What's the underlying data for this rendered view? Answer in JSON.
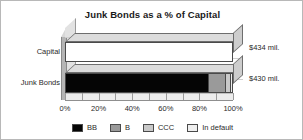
{
  "chart_data": {
    "type": "bar",
    "orientation": "horizontal",
    "stacked": true,
    "title": "Junk Bonds as a % of Capital",
    "xlabel": "",
    "ylabel": "",
    "xlim": [
      0,
      100
    ],
    "xtick_labels": [
      "0%",
      "20%",
      "40%",
      "60%",
      "80%",
      "100%"
    ],
    "xtick_values": [
      0,
      20,
      40,
      60,
      80,
      100
    ],
    "minor_tick_step": 10,
    "grid": true,
    "legend_position": "bottom",
    "categories": [
      "Capital",
      "Junk Bonds"
    ],
    "series": [
      {
        "name": "BB",
        "color": "#050505",
        "values": [
          0,
          86
        ]
      },
      {
        "name": "B",
        "color": "#9a9a9a",
        "values": [
          0,
          10
        ]
      },
      {
        "name": "CCC",
        "color": "#c9c9c9",
        "values": [
          0,
          3
        ]
      },
      {
        "name": "In default",
        "color": "#efefef",
        "values": [
          0,
          1
        ]
      }
    ],
    "bar_annotations": [
      "$434 mil.",
      "$430 mil."
    ],
    "bars": [
      {
        "category": "Capital",
        "value_label": "$434 mil.",
        "total": 100,
        "segments": [
          {
            "name": "unfilled",
            "start": 0,
            "end": 100,
            "color": "#ffffff",
            "class": "seg-empty"
          }
        ]
      },
      {
        "category": "Junk Bonds",
        "value_label": "$430 mil.",
        "total": 100,
        "segments": [
          {
            "name": "BB",
            "start": 0,
            "end": 86,
            "color": "#050505",
            "class": "seg-bb"
          },
          {
            "name": "B",
            "start": 86,
            "end": 96,
            "color": "#9a9a9a",
            "class": "seg-b"
          },
          {
            "name": "CCC",
            "start": 96,
            "end": 99,
            "color": "#c9c9c9",
            "class": "seg-ccc"
          },
          {
            "name": "In default",
            "start": 99,
            "end": 100,
            "color": "#efefef",
            "class": "seg-default"
          }
        ]
      }
    ],
    "legend": [
      {
        "label": "BB",
        "color": "#050505"
      },
      {
        "label": "B",
        "color": "#9a9a9a"
      },
      {
        "label": "CCC",
        "color": "#c9c9c9"
      },
      {
        "label": "In default",
        "color": "#efefef"
      }
    ]
  }
}
